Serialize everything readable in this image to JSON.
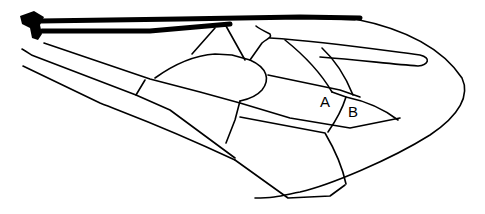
{
  "diagram": {
    "labels": [
      {
        "id": "A",
        "text": "A",
        "x": 320,
        "y": 107
      },
      {
        "id": "B",
        "text": "B",
        "x": 348,
        "y": 117
      }
    ],
    "colors": {
      "line": "#000000",
      "background": "#ffffff"
    }
  }
}
